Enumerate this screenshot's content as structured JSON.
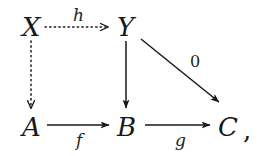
{
  "figure": {
    "kind": "commutative-diagram",
    "background_color": "#ffffff",
    "ink_color": "#181818",
    "trailing_punctuation": ","
  },
  "nodes": [
    {
      "id": "X",
      "label": "X",
      "x": 22,
      "y": 14
    },
    {
      "id": "Y",
      "label": "Y",
      "x": 117,
      "y": 14
    },
    {
      "id": "A",
      "label": "A",
      "x": 22,
      "y": 114
    },
    {
      "id": "B",
      "label": "B",
      "x": 117,
      "y": 114
    },
    {
      "id": "C",
      "label": "C",
      "x": 218,
      "y": 114
    }
  ],
  "edges": [
    {
      "id": "X-to-Y",
      "from": "X",
      "to": "Y",
      "label": "h",
      "style": "dotted",
      "head": "open",
      "direction": "right"
    },
    {
      "id": "X-to-A",
      "from": "X",
      "to": "A",
      "label": "",
      "style": "dotted",
      "head": "open",
      "direction": "down"
    },
    {
      "id": "Y-to-B",
      "from": "Y",
      "to": "B",
      "label": "",
      "style": "solid",
      "head": "filled",
      "direction": "down"
    },
    {
      "id": "Y-to-C",
      "from": "Y",
      "to": "C",
      "label": "0",
      "style": "solid",
      "head": "filled",
      "direction": "diagonal-down-right"
    },
    {
      "id": "A-to-B",
      "from": "A",
      "to": "B",
      "label": "f",
      "style": "solid",
      "head": "filled",
      "direction": "right"
    },
    {
      "id": "B-to-C",
      "from": "B",
      "to": "C",
      "label": "g",
      "style": "solid",
      "head": "filled",
      "direction": "right"
    }
  ],
  "edge_labels": {
    "h": {
      "text": "h",
      "x": 73,
      "y": 7
    },
    "zero": {
      "text": "0",
      "x": 190,
      "y": 54
    },
    "f": {
      "text": "f",
      "x": 76,
      "y": 132
    },
    "g": {
      "text": "g",
      "x": 175,
      "y": 132
    }
  }
}
